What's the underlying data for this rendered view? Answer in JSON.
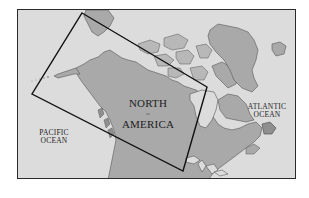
{
  "map": {
    "labels": {
      "continent_line1": "NORTH",
      "continent_line2": "AMERICA",
      "pacific_line1": "PACIFIC",
      "pacific_line2": "OCEAN",
      "atlantic_line1": "ATLANTIC",
      "atlantic_line2": "OCEAN"
    },
    "compass_glyph": "~",
    "colors": {
      "water": "#dcdcdc",
      "land": "#a9a9a9",
      "land_dark": "#8f8f8f",
      "frame": "#2a2a2a",
      "study_area_outline": "#111111"
    },
    "study_area": {
      "shape": "rotated-rectangle",
      "corners_px": [
        [
          81,
          12
        ],
        [
          206,
          86
        ],
        [
          182,
          170
        ],
        [
          31,
          93
        ]
      ]
    }
  }
}
